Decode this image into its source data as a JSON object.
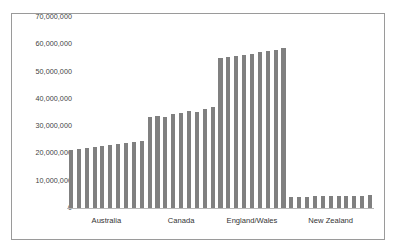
{
  "chart_data": {
    "type": "bar",
    "title": "",
    "subtitle": "",
    "xlabel": "",
    "ylabel": "",
    "ylim": [
      0,
      70000000
    ],
    "ytick_labels": [
      "70,000,000",
      "60,000,000",
      "50,000,000",
      "40,000,000",
      "30,000,000",
      "20,000,000",
      "10,000,000",
      "0"
    ],
    "ytick_values": [
      70000000,
      60000000,
      50000000,
      40000000,
      30000000,
      20000000,
      10000000,
      0
    ],
    "grid": false,
    "legend": "none",
    "bar_color": "#808080",
    "categories": [
      "Australia",
      "Canada",
      "England/Wales",
      "New Zealand"
    ],
    "groups": [
      {
        "name": "Australia",
        "values": [
          21300000,
          21600000,
          22000000,
          22400000,
          22700000,
          23100000,
          23500000,
          23900000,
          24300000,
          24700000
        ]
      },
      {
        "name": "Canada",
        "values": [
          33200000,
          33600000,
          33300000,
          34600000,
          35000000,
          35400000,
          35100000,
          36300000,
          36900000
        ]
      },
      {
        "name": "England/Wales",
        "values": [
          54800000,
          55300000,
          55700000,
          56100000,
          56600000,
          57000000,
          57500000,
          58000000,
          58500000
        ]
      },
      {
        "name": "New Zealand",
        "values": [
          4100000,
          4150000,
          4200000,
          4250000,
          4300000,
          4350000,
          4400000,
          4450000,
          4500000,
          4550000,
          4600000
        ]
      }
    ]
  }
}
